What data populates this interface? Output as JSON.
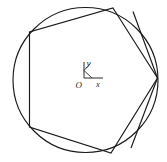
{
  "figure": {
    "background_color": "#ffffff",
    "stroke_color": "#1a1a1a",
    "axis_color": "#2b2b2b",
    "width": 167,
    "height": 162
  },
  "circle": {
    "name": "circumscribed-circle",
    "center_x": 85.5,
    "center_y": 80,
    "radius": 72.5
  },
  "polygon": {
    "name": "inscribed-hexagon",
    "sides": 6,
    "vertices": [
      {
        "label": "top",
        "x": 113,
        "y": 8
      },
      {
        "label": "right",
        "x": 157.5,
        "y": 78
      },
      {
        "label": "bottom",
        "x": 111,
        "y": 153
      },
      {
        "label": "bottom-left",
        "x": 29.5,
        "y": 127
      },
      {
        "label": "top-left",
        "x": 29.5,
        "y": 32
      }
    ],
    "points_attr": "113,8 157.5,78 111,153 29.5,127 29.5,32"
  },
  "extra_chords": [
    {
      "name": "chord-top-to-right-vertex",
      "x1": 133,
      "y1": 11.5,
      "x2": 157.5,
      "y2": 78
    },
    {
      "name": "chord-right-vertex-to-bottom",
      "x1": 157.5,
      "y1": 78,
      "x2": 131,
      "y2": 148
    }
  ],
  "axis_marker": {
    "name": "coordinate-axis-marker",
    "origin_x": 84,
    "origin_y": 78,
    "y_axis": {
      "x1": 84,
      "y1": 78,
      "x2": 84,
      "y2": 62
    },
    "x_axis": {
      "x1": 84,
      "y1": 78,
      "x2": 103,
      "y2": 78
    },
    "diagonal_tick": {
      "x1": 84,
      "y1": 70.5,
      "x2": 92,
      "y2": 78
    },
    "upper_tick": {
      "x1": 84,
      "y1": 70.5,
      "x2": 90.5,
      "y2": 63.5
    },
    "labels": {
      "y": "y",
      "x": "x",
      "origin": "O"
    },
    "label_positions": {
      "y": {
        "x": 86.5,
        "y": 66
      },
      "x": {
        "x": 96,
        "y": 87
      },
      "origin": {
        "x": 75.5,
        "y": 88
      }
    }
  }
}
